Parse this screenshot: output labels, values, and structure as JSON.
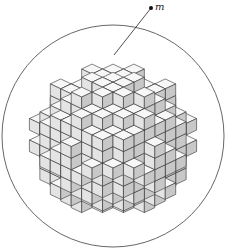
{
  "diagram": {
    "label": "m",
    "label_pointer": {
      "dot": [
        151,
        8
      ],
      "target": [
        114,
        55
      ]
    },
    "circle": {
      "cx": 113,
      "cy": 136,
      "r": 111
    },
    "colors": {
      "top": "#f7f7f7",
      "left": "#e4e4e4",
      "right": "#c8c8c8",
      "stroke": "#333333",
      "circle": "#555555"
    },
    "cube_size": 18
  }
}
